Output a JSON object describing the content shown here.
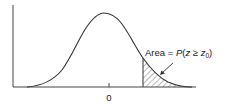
{
  "diagram": {
    "type": "normal-distribution-tail-area",
    "x_tick_label": "0",
    "annotation": {
      "prefix": "Area = ",
      "func": "P",
      "open": "(",
      "var": "z",
      "relation": " ≥ ",
      "threshold_var": "z",
      "threshold_sub": "0",
      "close": ")"
    },
    "colors": {
      "line": "#333333",
      "hatch": "#555555",
      "background": "#ffffff"
    }
  }
}
